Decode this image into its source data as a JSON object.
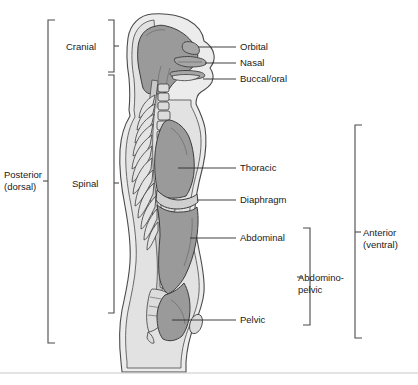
{
  "figure": {
    "colors": {
      "cavity_gray": "#9a9a9a",
      "body_fill": "#ececec",
      "body_inner": "#e2e2e2",
      "bone_fill": "#dcdcdc",
      "outline": "#4a4a4a",
      "text": "#1a1a1a",
      "footer_rule": "#c8c8c8"
    }
  },
  "left_brackets": [
    {
      "id": "posterior",
      "label_line1": "Posterior",
      "label_line2": "(dorsal)",
      "span_top": 20,
      "span_bottom": 343
    },
    {
      "id": "cranial",
      "label_line1": "Cranial",
      "label_line2": "",
      "span_top": 20,
      "span_bottom": 72
    },
    {
      "id": "spinal",
      "label_line1": "Spinal",
      "label_line2": "",
      "span_top": 75,
      "span_bottom": 313
    }
  ],
  "right_brackets": [
    {
      "id": "anterior",
      "label_line1": "Anterior",
      "label_line2": "(ventral)",
      "span_top": 125,
      "span_bottom": 338
    },
    {
      "id": "abdominopelvic",
      "label_line1": "Abdomino-",
      "label_line2": "pelvic",
      "span_top": 228,
      "span_bottom": 325
    }
  ],
  "callouts": [
    {
      "id": "orbital",
      "label": "Orbital",
      "leader_x1": 198,
      "leader_y1": 47,
      "leader_x2": 236,
      "leader_y2": 47,
      "text_x": 240,
      "text_y": 50
    },
    {
      "id": "nasal",
      "label": "Nasal",
      "leader_x1": 205,
      "leader_y1": 63,
      "leader_x2": 236,
      "leader_y2": 63,
      "text_x": 240,
      "text_y": 66
    },
    {
      "id": "buccal",
      "label": "Buccal/oral",
      "leader_x1": 203,
      "leader_y1": 79,
      "leader_x2": 236,
      "leader_y2": 79,
      "text_x": 240,
      "text_y": 82
    },
    {
      "id": "thoracic",
      "label": "Thoracic",
      "leader_x1": 178,
      "leader_y1": 168,
      "leader_x2": 236,
      "leader_y2": 168,
      "text_x": 240,
      "text_y": 171
    },
    {
      "id": "diaphragm",
      "label": "Diaphragm",
      "leader_x1": 200,
      "leader_y1": 200,
      "leader_x2": 236,
      "leader_y2": 200,
      "text_x": 240,
      "text_y": 203
    },
    {
      "id": "abdominal",
      "label": "Abdominal",
      "leader_x1": 190,
      "leader_y1": 238,
      "leader_x2": 236,
      "leader_y2": 238,
      "text_x": 240,
      "text_y": 241
    },
    {
      "id": "pelvic",
      "label": "Pelvic",
      "leader_x1": 172,
      "leader_y1": 320,
      "leader_x2": 236,
      "leader_y2": 320,
      "text_x": 240,
      "text_y": 323
    }
  ],
  "footer": {
    "rule_y": 373
  }
}
